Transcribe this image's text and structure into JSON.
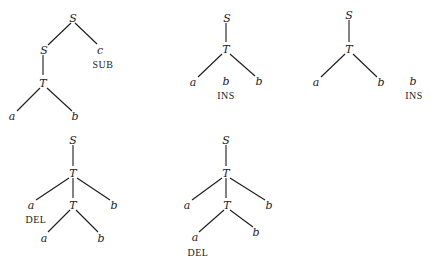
{
  "diagram": {
    "type": "parse-tree-edit-operations",
    "line_color": "#1a1a1a",
    "text_color": "#222222",
    "background": "#ffffff",
    "trees": [
      {
        "id": "tree-sub",
        "operation": "SUB",
        "nodes": [
          {
            "id": "n1",
            "label": "S",
            "x": 73,
            "y": 19
          },
          {
            "id": "n2",
            "label": "S",
            "x": 44,
            "y": 51
          },
          {
            "id": "n3",
            "label": "c",
            "x": 100,
            "y": 51
          },
          {
            "id": "n4",
            "label": "T",
            "x": 43,
            "y": 84
          },
          {
            "id": "n5",
            "label": "a",
            "x": 12,
            "y": 117
          },
          {
            "id": "n6",
            "label": "b",
            "x": 75,
            "y": 117
          }
        ],
        "edges": [
          {
            "x1": 71,
            "y1": 23,
            "x2": 48,
            "y2": 45
          },
          {
            "x1": 75,
            "y1": 23,
            "x2": 97,
            "y2": 44
          },
          {
            "x1": 43,
            "y1": 55,
            "x2": 43,
            "y2": 75
          },
          {
            "x1": 40,
            "y1": 88,
            "x2": 17,
            "y2": 111
          },
          {
            "x1": 47,
            "y1": 88,
            "x2": 72,
            "y2": 111
          }
        ],
        "annotations": [
          {
            "text": "SUB",
            "x": 103,
            "y": 66,
            "kind": "operation"
          }
        ]
      },
      {
        "id": "tree-ins-1",
        "operation": "INS",
        "nodes": [
          {
            "id": "n1",
            "label": "S",
            "x": 227,
            "y": 19
          },
          {
            "id": "n2",
            "label": "T",
            "x": 226,
            "y": 50
          },
          {
            "id": "n3",
            "label": "a",
            "x": 193,
            "y": 83
          },
          {
            "id": "n4",
            "label": "b",
            "x": 226,
            "y": 82
          },
          {
            "id": "n5",
            "label": "b",
            "x": 259,
            "y": 82
          }
        ],
        "edges": [
          {
            "x1": 226,
            "y1": 23,
            "x2": 226,
            "y2": 42
          },
          {
            "x1": 222,
            "y1": 54,
            "x2": 198,
            "y2": 77
          },
          {
            "x1": 230,
            "y1": 54,
            "x2": 255,
            "y2": 76
          }
        ],
        "annotations": [
          {
            "text": "INS",
            "x": 226,
            "y": 97,
            "kind": "operation"
          }
        ]
      },
      {
        "id": "tree-ins-2",
        "operation": "INS",
        "nodes": [
          {
            "id": "n1",
            "label": "S",
            "x": 349,
            "y": 16
          },
          {
            "id": "n2",
            "label": "T",
            "x": 349,
            "y": 50
          },
          {
            "id": "n3",
            "label": "a",
            "x": 316,
            "y": 83
          },
          {
            "id": "n4",
            "label": "b",
            "x": 381,
            "y": 83
          },
          {
            "id": "n5",
            "label": "b",
            "x": 413,
            "y": 82
          }
        ],
        "edges": [
          {
            "x1": 349,
            "y1": 20,
            "x2": 349,
            "y2": 42
          },
          {
            "x1": 345,
            "y1": 54,
            "x2": 321,
            "y2": 77
          },
          {
            "x1": 353,
            "y1": 54,
            "x2": 377,
            "y2": 77
          }
        ],
        "annotations": [
          {
            "text": "INS",
            "x": 414,
            "y": 97,
            "kind": "operation"
          }
        ]
      },
      {
        "id": "tree-del-1",
        "operation": "DEL",
        "nodes": [
          {
            "id": "n1",
            "label": "S",
            "x": 73,
            "y": 141
          },
          {
            "id": "n2",
            "label": "T",
            "x": 73,
            "y": 174
          },
          {
            "id": "n3",
            "label": "a",
            "x": 31,
            "y": 206
          },
          {
            "id": "n4",
            "label": "T",
            "x": 73,
            "y": 206
          },
          {
            "id": "n5",
            "label": "b",
            "x": 114,
            "y": 206
          },
          {
            "id": "n6",
            "label": "a",
            "x": 44,
            "y": 239
          },
          {
            "id": "n7",
            "label": "b",
            "x": 101,
            "y": 239
          }
        ],
        "edges": [
          {
            "x1": 73,
            "y1": 145,
            "x2": 73,
            "y2": 166
          },
          {
            "x1": 69,
            "y1": 178,
            "x2": 36,
            "y2": 200
          },
          {
            "x1": 73,
            "y1": 178,
            "x2": 73,
            "y2": 198
          },
          {
            "x1": 77,
            "y1": 178,
            "x2": 110,
            "y2": 200
          },
          {
            "x1": 70,
            "y1": 210,
            "x2": 48,
            "y2": 232
          },
          {
            "x1": 76,
            "y1": 210,
            "x2": 98,
            "y2": 232
          }
        ],
        "annotations": [
          {
            "text": "DEL",
            "x": 36,
            "y": 221,
            "kind": "operation"
          }
        ]
      },
      {
        "id": "tree-del-2",
        "operation": "DEL",
        "nodes": [
          {
            "id": "n1",
            "label": "S",
            "x": 226,
            "y": 141
          },
          {
            "id": "n2",
            "label": "T",
            "x": 226,
            "y": 174
          },
          {
            "id": "n3",
            "label": "a",
            "x": 187,
            "y": 206
          },
          {
            "id": "n4",
            "label": "T",
            "x": 227,
            "y": 206
          },
          {
            "id": "n5",
            "label": "b",
            "x": 269,
            "y": 206
          },
          {
            "id": "n6",
            "label": "a",
            "x": 195,
            "y": 238
          },
          {
            "id": "n7",
            "label": "b",
            "x": 256,
            "y": 233
          }
        ],
        "edges": [
          {
            "x1": 226,
            "y1": 145,
            "x2": 226,
            "y2": 166
          },
          {
            "x1": 222,
            "y1": 178,
            "x2": 192,
            "y2": 200
          },
          {
            "x1": 226,
            "y1": 178,
            "x2": 226,
            "y2": 198
          },
          {
            "x1": 230,
            "y1": 178,
            "x2": 265,
            "y2": 200
          },
          {
            "x1": 224,
            "y1": 210,
            "x2": 199,
            "y2": 232
          },
          {
            "x1": 230,
            "y1": 210,
            "x2": 253,
            "y2": 227
          }
        ],
        "annotations": [
          {
            "text": "DEL",
            "x": 198,
            "y": 254,
            "kind": "operation"
          }
        ]
      }
    ]
  }
}
